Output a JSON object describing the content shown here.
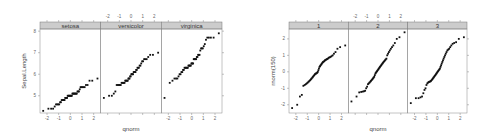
{
  "chart_data": [
    {
      "type": "scatter",
      "subtype": "qq",
      "title": "",
      "xlabel": "qnorm",
      "ylabel": "Sepal.Length",
      "panels": [
        "setosa",
        "versicolor",
        "virginica"
      ],
      "xticks": [
        "-2",
        "-1",
        "0",
        "1",
        "2"
      ],
      "yticks": [
        "5",
        "6",
        "7",
        "8"
      ],
      "xlim": [
        -2.6,
        2.6
      ],
      "ylim": [
        4.2,
        8.1
      ],
      "grid": false,
      "legend": "none",
      "series": [
        {
          "name": "setosa",
          "q_range": [
            -2.33,
            2.33
          ],
          "y_range": [
            4.3,
            5.8
          ],
          "y": [
            4.3,
            4.4,
            4.4,
            4.4,
            4.5,
            4.6,
            4.6,
            4.6,
            4.6,
            4.7,
            4.7,
            4.8,
            4.8,
            4.8,
            4.8,
            4.8,
            4.9,
            4.9,
            4.9,
            4.9,
            5.0,
            5.0,
            5.0,
            5.0,
            5.0,
            5.0,
            5.0,
            5.0,
            5.1,
            5.1,
            5.1,
            5.1,
            5.1,
            5.1,
            5.1,
            5.1,
            5.2,
            5.2,
            5.2,
            5.3,
            5.4,
            5.4,
            5.4,
            5.4,
            5.4,
            5.5,
            5.5,
            5.7,
            5.7,
            5.8
          ]
        },
        {
          "name": "versicolor",
          "q_range": [
            -2.33,
            2.33
          ],
          "y_range": [
            4.9,
            7.0
          ],
          "y": [
            4.9,
            5.0,
            5.0,
            5.1,
            5.2,
            5.5,
            5.5,
            5.5,
            5.5,
            5.5,
            5.6,
            5.6,
            5.6,
            5.6,
            5.6,
            5.7,
            5.7,
            5.7,
            5.7,
            5.7,
            5.8,
            5.8,
            5.8,
            5.9,
            5.9,
            6.0,
            6.0,
            6.0,
            6.0,
            6.1,
            6.1,
            6.1,
            6.1,
            6.2,
            6.2,
            6.3,
            6.3,
            6.3,
            6.4,
            6.4,
            6.5,
            6.6,
            6.6,
            6.7,
            6.7,
            6.7,
            6.8,
            6.9,
            6.9,
            7.0
          ]
        },
        {
          "name": "virginica",
          "q_range": [
            -2.33,
            2.33
          ],
          "y_range": [
            4.9,
            7.9
          ],
          "y": [
            4.9,
            5.6,
            5.7,
            5.8,
            5.8,
            5.8,
            5.9,
            6.0,
            6.0,
            6.1,
            6.1,
            6.2,
            6.2,
            6.3,
            6.3,
            6.3,
            6.3,
            6.3,
            6.3,
            6.4,
            6.4,
            6.4,
            6.4,
            6.4,
            6.5,
            6.5,
            6.5,
            6.5,
            6.7,
            6.7,
            6.7,
            6.7,
            6.7,
            6.8,
            6.8,
            6.9,
            6.9,
            6.9,
            7.1,
            7.2,
            7.2,
            7.2,
            7.3,
            7.4,
            7.6,
            7.7,
            7.7,
            7.7,
            7.7,
            7.9
          ]
        }
      ]
    },
    {
      "type": "scatter",
      "subtype": "qq",
      "title": "",
      "xlabel": "qnorm",
      "ylabel": "rnorm(150)",
      "panels": [
        "1",
        "2",
        "3"
      ],
      "xticks": [
        "-2",
        "-1",
        "0",
        "1",
        "2"
      ],
      "yticks": [
        "-2",
        "-1",
        "0",
        "1",
        "2"
      ],
      "xlim": [
        -2.6,
        2.6
      ],
      "ylim": [
        -2.5,
        2.6
      ],
      "grid": false,
      "legend": "none",
      "series": [
        {
          "name": "1",
          "q_range": [
            -2.33,
            2.33
          ],
          "y": [
            -2.2,
            -2.0,
            -1.5,
            -1.4,
            -0.85,
            -0.8,
            -0.75,
            -0.7,
            -0.65,
            -0.6,
            -0.55,
            -0.5,
            -0.45,
            -0.4,
            -0.35,
            -0.3,
            -0.25,
            -0.2,
            -0.15,
            -0.12,
            -0.1,
            -0.08,
            -0.05,
            0.0,
            0.1,
            0.2,
            0.3,
            0.35,
            0.4,
            0.45,
            0.5,
            0.55,
            0.6,
            0.62,
            0.65,
            0.7,
            0.72,
            0.75,
            0.78,
            0.8,
            0.85,
            0.88,
            0.9,
            0.95,
            1.0,
            1.1,
            1.2,
            1.4,
            1.5,
            1.6
          ]
        },
        {
          "name": "2",
          "q_range": [
            -2.33,
            2.33
          ],
          "y": [
            -1.8,
            -1.5,
            -1.25,
            -1.22,
            -1.2,
            -1.18,
            -1.15,
            -1.0,
            -0.9,
            -0.75,
            -0.7,
            -0.65,
            -0.6,
            -0.55,
            -0.5,
            -0.45,
            -0.4,
            -0.35,
            -0.3,
            -0.2,
            -0.1,
            -0.05,
            0.0,
            0.05,
            0.1,
            0.15,
            0.2,
            0.25,
            0.3,
            0.35,
            0.4,
            0.45,
            0.5,
            0.55,
            0.6,
            0.65,
            0.7,
            0.75,
            0.8,
            1.0,
            1.1,
            1.2,
            1.3,
            1.4,
            1.5,
            1.6,
            1.75,
            2.0,
            2.1,
            2.4
          ]
        },
        {
          "name": "3",
          "q_range": [
            -2.33,
            2.33
          ],
          "y": [
            -1.9,
            -1.6,
            -1.6,
            -1.55,
            -1.5,
            -1.3,
            -1.1,
            -1.0,
            -0.8,
            -0.7,
            -0.65,
            -0.62,
            -0.6,
            -0.58,
            -0.55,
            -0.5,
            -0.45,
            -0.4,
            -0.35,
            -0.3,
            -0.25,
            -0.2,
            -0.15,
            -0.1,
            -0.05,
            0.0,
            0.05,
            0.1,
            0.15,
            0.2,
            0.3,
            0.4,
            0.5,
            0.6,
            0.7,
            0.8,
            0.9,
            1.0,
            1.1,
            1.2,
            1.3,
            1.35,
            1.4,
            1.5,
            1.6,
            1.7,
            1.75,
            1.8,
            2.0,
            2.1
          ]
        }
      ]
    }
  ]
}
